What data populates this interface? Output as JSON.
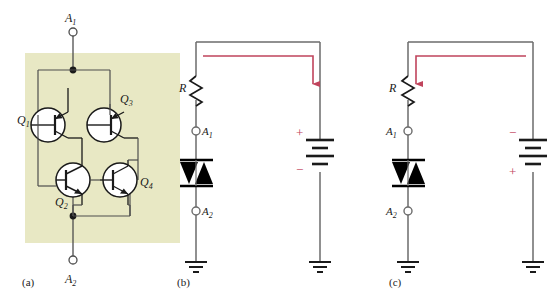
{
  "figure": {
    "type": "circuit-diagram",
    "background_color": "#ffffff",
    "wire_color": "#4d4d4d",
    "device_color": "#000000",
    "current_color": "#c0445c",
    "shade_color": "#e8e8c4"
  },
  "panels": [
    {
      "id": "a",
      "caption": "(a)",
      "title": "four-transistor equivalent",
      "terminals": [
        {
          "name": "A1",
          "label": "A",
          "sub": "1",
          "position": "top"
        },
        {
          "name": "A2",
          "label": "A",
          "sub": "2",
          "position": "bottom"
        }
      ],
      "transistors": [
        {
          "name": "Q1",
          "label": "Q",
          "sub": "1",
          "kind": "pnp",
          "label_side": "left"
        },
        {
          "name": "Q2",
          "label": "Q",
          "sub": "2",
          "kind": "npn",
          "label_side": "left"
        },
        {
          "name": "Q3",
          "label": "Q",
          "sub": "3",
          "kind": "pnp",
          "label_side": "right"
        },
        {
          "name": "Q4",
          "label": "Q",
          "sub": "4",
          "kind": "npn",
          "label_side": "right"
        }
      ]
    },
    {
      "id": "b",
      "caption": "(b)",
      "title": "forward bias",
      "resistor": {
        "label": "R",
        "side": "left"
      },
      "terminals": [
        {
          "name": "A1",
          "label": "A",
          "sub": "1",
          "label_side": "right"
        },
        {
          "name": "A2",
          "label": "A",
          "sub": "2",
          "label_side": "right"
        }
      ],
      "device": {
        "name": "diac",
        "symbol": "bidirectional-trigger-diode"
      },
      "battery": {
        "top_sign": "+",
        "bottom_sign": "−",
        "cells": 2
      },
      "current": {
        "direction": "clockwise",
        "arrow_head": "down",
        "arrow_position": "right-branch"
      },
      "grounds": 2
    },
    {
      "id": "c",
      "caption": "(c)",
      "title": "reverse bias",
      "resistor": {
        "label": "R",
        "side": "left"
      },
      "terminals": [
        {
          "name": "A1",
          "label": "A",
          "sub": "1",
          "label_side": "left"
        },
        {
          "name": "A2",
          "label": "A",
          "sub": "2",
          "label_side": "left"
        }
      ],
      "device": {
        "name": "diac",
        "symbol": "bidirectional-trigger-diode"
      },
      "battery": {
        "top_sign": "−",
        "bottom_sign": "+",
        "cells": 2
      },
      "current": {
        "direction": "counter-clockwise",
        "arrow_head": "down",
        "arrow_position": "left-branch"
      },
      "grounds": 2
    }
  ]
}
